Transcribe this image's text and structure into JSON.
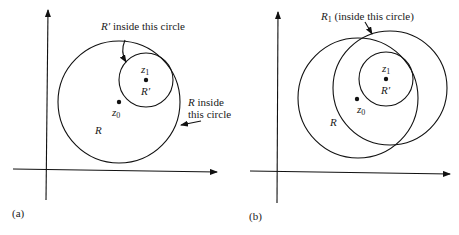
{
  "panels": [
    {
      "id": "a",
      "caption": "(a)",
      "labels": {
        "r_prime_callout_var": "R′",
        "r_prime_callout_text": " inside this circle",
        "z1_var": "z",
        "z1_sub": "1",
        "r_prime_region": "R′",
        "z0_var": "z",
        "z0_sub": "0",
        "r_region": "R",
        "r_callout_var": "R",
        "r_callout_line1": " inside",
        "r_callout_line2": "this circle"
      },
      "geometry": {
        "axes": {
          "origin": [
            46,
            170
          ],
          "x_end": 217,
          "y_end": 10
        },
        "circle_R": {
          "cx": 119,
          "cy": 102,
          "r": 61
        },
        "circle_R_prime": {
          "cx": 146,
          "cy": 80,
          "r": 27
        },
        "point_z1": [
          146,
          80
        ],
        "point_z0": [
          119,
          102
        ]
      }
    },
    {
      "id": "b",
      "caption": "(b)",
      "labels": {
        "r1_callout_var": "R",
        "r1_callout_sub": "1",
        "r1_callout_text": " (inside this circle)",
        "z1_var": "z",
        "z1_sub": "1",
        "r_prime_region": "R′",
        "z0_var": "z",
        "z0_sub": "0",
        "r_region": "R"
      },
      "geometry": {
        "axes": {
          "origin": [
            278,
            172
          ],
          "x_end": 450,
          "y_end": 12
        },
        "circle_R": {
          "cx": 358,
          "cy": 98,
          "r": 60
        },
        "circle_R1": {
          "cx": 390,
          "cy": 88,
          "r": 57
        },
        "circle_R_prime": {
          "cx": 386,
          "cy": 79,
          "r": 27
        },
        "point_z1": [
          386,
          79
        ],
        "point_z0": [
          357,
          99
        ]
      }
    }
  ]
}
